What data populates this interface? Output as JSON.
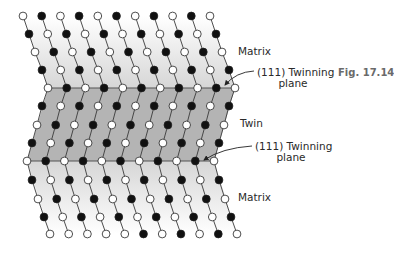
{
  "figure": {
    "number_label": "Fig. 17.14",
    "labels": {
      "matrix_top": "Matrix",
      "twin": "Twin",
      "matrix_bottom": "Matrix",
      "plane_top_line1": "(111) Twinning",
      "plane_top_line2": "plane",
      "plane_bottom_line1": "(111) Twinning",
      "plane_bottom_line2": "plane"
    },
    "colors": {
      "matrix_shade": "#d6d6d6",
      "twin_shade": "#b4b4b4",
      "bond_line": "#3a3a3a",
      "plane_line": "#555555",
      "atom_black": "#111111",
      "atom_white": "#ffffff",
      "atom_stroke": "#222222"
    },
    "lattice": {
      "column_spacing": 18.7,
      "atom_radius": 3.9,
      "columns": 11,
      "rows": [
        {
          "y": 16,
          "x0": 23,
          "region": "matrix",
          "colors": "wbwbwbwbwbw"
        },
        {
          "y": 34,
          "x0": 29,
          "region": "matrix",
          "colors": "bwbwbwbwbwb"
        },
        {
          "y": 52,
          "x0": 35,
          "region": "matrix",
          "colors": "wbwbwbwbwbw"
        },
        {
          "y": 70,
          "x0": 42,
          "region": "matrix",
          "colors": "bwbwbwbwbwb"
        },
        {
          "y": 88,
          "x0": 48,
          "region": "plane",
          "colors": "wbwbwbwbwbw"
        },
        {
          "y": 106,
          "x0": 42,
          "region": "twin",
          "colors": "bwbwbwbwbwb"
        },
        {
          "y": 125,
          "x0": 37,
          "region": "twin",
          "colors": "wbwbwbwbwbw"
        },
        {
          "y": 143,
          "x0": 32,
          "region": "twin",
          "colors": "bwbwbwbwbwb"
        },
        {
          "y": 161,
          "x0": 27,
          "region": "plane",
          "colors": "wbwbwbwbwbw"
        },
        {
          "y": 180,
          "x0": 32,
          "region": "matrix",
          "colors": "bwbwbwbwbwb"
        },
        {
          "y": 199,
          "x0": 38,
          "region": "matrix",
          "colors": "wbwbwbwbwbw"
        },
        {
          "y": 217,
          "x0": 44,
          "region": "matrix",
          "colors": "bwbwbwbwbwb"
        },
        {
          "y": 234,
          "x0": 50,
          "region": "matrix",
          "colors": "wwwwwbwbwbw"
        }
      ]
    },
    "arrows": [
      {
        "name": "plane-top-arrow",
        "path": "M 254 71 Q 236 72 225 85"
      },
      {
        "name": "plane-bottom-arrow",
        "path": "M 252 146 Q 222 148 204 160"
      }
    ]
  }
}
